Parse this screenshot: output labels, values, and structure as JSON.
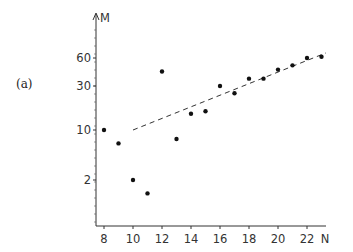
{
  "panel_label": "(a)",
  "chart_data": {
    "type": "scatter",
    "title": "",
    "xlabel": "N",
    "ylabel": "M",
    "yscale": "log",
    "x_ticks": [
      8,
      10,
      12,
      14,
      16,
      18,
      20,
      22
    ],
    "y_ticks": [
      2,
      10,
      30,
      60
    ],
    "xlim": [
      7.5,
      24
    ],
    "grid": false,
    "series": [
      {
        "name": "data",
        "marker": "filled-circle",
        "points": [
          {
            "x": 8,
            "y": 10
          },
          {
            "x": 9,
            "y": 6.5
          },
          {
            "x": 10,
            "y": 2
          },
          {
            "x": 11,
            "y": 1.3
          },
          {
            "x": 12,
            "y": 43
          },
          {
            "x": 13,
            "y": 7.5
          },
          {
            "x": 14,
            "y": 15
          },
          {
            "x": 15,
            "y": 16
          },
          {
            "x": 16,
            "y": 30
          },
          {
            "x": 17,
            "y": 25
          },
          {
            "x": 18,
            "y": 36
          },
          {
            "x": 19,
            "y": 36
          },
          {
            "x": 20,
            "y": 45
          },
          {
            "x": 21,
            "y": 50
          },
          {
            "x": 22,
            "y": 60
          },
          {
            "x": 23,
            "y": 62
          }
        ]
      },
      {
        "name": "fit",
        "style": "dashed-line",
        "points": [
          {
            "x": 10,
            "y": 10
          },
          {
            "x": 23.3,
            "y": 68
          }
        ]
      }
    ]
  }
}
